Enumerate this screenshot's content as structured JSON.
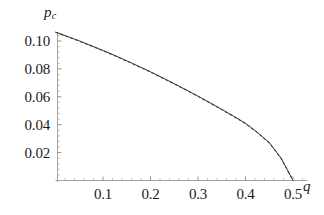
{
  "figure": {
    "background_color": "#ffffff",
    "line_color": "#3a3a3a",
    "axis_color": "#8a8a8a",
    "text_color": "#1b1b1b"
  },
  "axes": {
    "y_axis_title": "p",
    "y_axis_title_sub": "c",
    "x_axis_title": "q",
    "y_ticks": [
      "0.02",
      "0.04",
      "0.06",
      "0.08",
      "0.10"
    ],
    "y_tick_values": [
      0.02,
      0.04,
      0.06,
      0.08,
      0.1
    ],
    "x_ticks": [
      "0.1",
      "0.2",
      "0.3",
      "0.4",
      "0.5"
    ],
    "x_tick_values": [
      0.1,
      0.2,
      0.3,
      0.4,
      0.5
    ]
  },
  "chart_data": {
    "type": "line",
    "title": "",
    "xlabel": "q",
    "ylabel": "p_c",
    "xlim": [
      0.0,
      0.52
    ],
    "ylim": [
      0.0,
      0.1145
    ],
    "grid": false,
    "legend": null,
    "x": [
      0.0,
      0.025,
      0.05,
      0.075,
      0.1,
      0.125,
      0.15,
      0.175,
      0.2,
      0.225,
      0.25,
      0.275,
      0.3,
      0.325,
      0.35,
      0.375,
      0.4,
      0.425,
      0.45,
      0.475,
      0.5
    ],
    "series": [
      {
        "name": "solid-curve",
        "style": "solid",
        "values": [
          0.1064,
          0.1033,
          0.1001,
          0.0967,
          0.0932,
          0.0896,
          0.0858,
          0.0819,
          0.0779,
          0.0737,
          0.0694,
          0.065,
          0.0605,
          0.0558,
          0.051,
          0.0461,
          0.041,
          0.0345,
          0.0272,
          0.016,
          0.0
        ]
      },
      {
        "name": "dashed-curve",
        "style": "dashed",
        "values": [
          0.1062,
          0.1031,
          0.0999,
          0.0965,
          0.093,
          0.0894,
          0.0856,
          0.0817,
          0.0777,
          0.0735,
          0.0692,
          0.0648,
          0.0603,
          0.0556,
          0.0508,
          0.0459,
          0.0408,
          0.0343,
          0.027,
          0.0158,
          0.0
        ]
      }
    ]
  }
}
